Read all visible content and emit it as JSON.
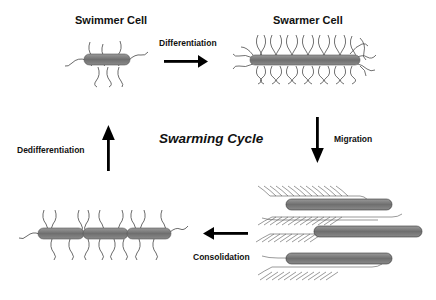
{
  "diagram": {
    "center_label": "Swarming Cycle",
    "stages": [
      {
        "name": "Swimmer Cell"
      },
      {
        "name": "Swarmer Cell"
      }
    ],
    "transitions": [
      {
        "label": "Differentiation",
        "direction": "right"
      },
      {
        "label": "Migration",
        "direction": "down"
      },
      {
        "label": "Consolidation",
        "direction": "left"
      },
      {
        "label": "Dedifferentiation",
        "direction": "up"
      }
    ],
    "colors": {
      "cell_body": "#7a7a7a",
      "flagella": "#444444",
      "arrow": "#000000",
      "text": "#111111"
    }
  }
}
